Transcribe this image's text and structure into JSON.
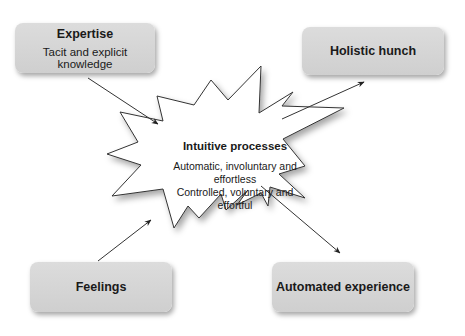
{
  "nodes": {
    "expertise": {
      "title": "Expertise",
      "subtitle": "Tacit and explicit knowledge"
    },
    "holistic_hunch": {
      "title": "Holistic hunch"
    },
    "feelings": {
      "title": "Feelings"
    },
    "automated_experience": {
      "title": "Automated experience"
    },
    "intuitive_processes": {
      "title": "Intuitive processes",
      "line1": "Automatic, involuntary and effortless",
      "line2": "Controlled, voluntary and effortful"
    }
  },
  "edges": [
    {
      "from": "Expertise",
      "to": "Intuitive processes"
    },
    {
      "from": "Feelings",
      "to": "Intuitive processes"
    },
    {
      "from": "Intuitive processes",
      "to": "Holistic hunch"
    },
    {
      "from": "Intuitive processes",
      "to": "Automated experience"
    }
  ],
  "colors": {
    "box_fill": "#d4d4d4",
    "star_fill": "#ffffff",
    "stroke": "#333333"
  }
}
